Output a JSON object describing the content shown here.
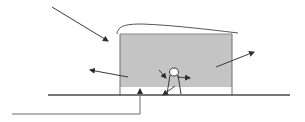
{
  "diagram": {
    "title": "",
    "colors": {
      "background": "#ffffff",
      "box_fill": "#c4c4c4",
      "box_stroke": "#6e6e6e",
      "line": "#4a4a4a",
      "arrow": "#3a3a3a"
    },
    "elements": {
      "structure_box": {
        "x": 120,
        "y": 34,
        "width": 112,
        "height": 60,
        "shaded_height": 53
      },
      "roof_curve": {
        "start": [
          117,
          34
        ],
        "peak": [
          140,
          24
        ],
        "end": [
          238,
          33
        ]
      },
      "ground_line": {
        "x1": 48,
        "x2": 290,
        "y": 95
      },
      "person_figure": {
        "head_center": [
          174,
          72
        ],
        "feet": [
          [
            167,
            94
          ],
          [
            181,
            94
          ]
        ]
      }
    },
    "arrows": [
      {
        "name": "incoming-radiation-arrow",
        "from": [
          52,
          7
        ],
        "to": [
          108,
          41
        ]
      },
      {
        "name": "left-outgoing-arrow",
        "from": [
          128,
          77
        ],
        "to": [
          90,
          70
        ]
      },
      {
        "name": "right-outgoing-arrow",
        "from": [
          216,
          67
        ],
        "to": [
          254,
          52
        ]
      },
      {
        "name": "toward-person-arrow",
        "from": [
          159,
          70
        ],
        "to": [
          166,
          78
        ]
      },
      {
        "name": "from-person-right-arrow",
        "from": [
          177,
          77
        ],
        "to": [
          190,
          78
        ]
      },
      {
        "name": "from-person-down-arrow",
        "from": [
          175,
          86
        ],
        "to": [
          163,
          95
        ]
      },
      {
        "name": "ground-up-arrow",
        "path": [
          [
            12,
            114
          ],
          [
            140,
            114
          ],
          [
            140,
            89
          ]
        ]
      }
    ],
    "labels": []
  }
}
